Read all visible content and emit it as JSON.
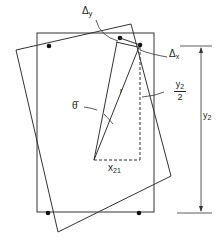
{
  "diagram": {
    "type": "geometric-rotation-schematic",
    "colors": {
      "line": "#333333",
      "background": "#ffffff"
    },
    "labels": {
      "delta_y": {
        "symbol": "Δ",
        "sub": "y"
      },
      "delta_x": {
        "symbol": "Δ",
        "sub": "x"
      },
      "half_y2": {
        "num": "y",
        "num_sub": "2",
        "den": "2"
      },
      "y2": {
        "base": "y",
        "sub": "2"
      },
      "theta": "θ̄",
      "r": "r",
      "x21": {
        "base": "x",
        "sub": "21"
      }
    },
    "shapes": {
      "upright_rectangle": "original-section",
      "tilted_rectangle": "rotated-section",
      "triangle": "rotation-triangle",
      "dimension": "y2-dimension-line"
    },
    "points": [
      "top-left-bar",
      "top-right-bar",
      "bottom-left-bar",
      "bottom-right-bar",
      "displaced-bar"
    ]
  }
}
